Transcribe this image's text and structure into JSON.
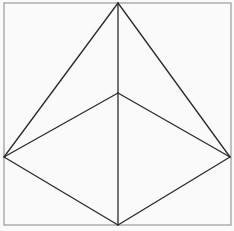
{
  "diagram": {
    "type": "geometric-figure",
    "colors": {
      "background": "#fafafa",
      "frame": "#9a9a9a",
      "lines": "#2a2a2a"
    },
    "frame": {
      "x": 4,
      "y": 3,
      "width": 227,
      "height": 222
    },
    "vertices": {
      "top": [
        118,
        3
      ],
      "middle": [
        118,
        93
      ],
      "left": [
        4,
        157
      ],
      "right": [
        230,
        157
      ],
      "bottom": [
        118,
        225
      ]
    },
    "edges": [
      [
        "top",
        "left"
      ],
      [
        "top",
        "right"
      ],
      [
        "top",
        "middle"
      ],
      [
        "middle",
        "left"
      ],
      [
        "middle",
        "right"
      ],
      [
        "middle",
        "bottom"
      ],
      [
        "left",
        "bottom"
      ],
      [
        "right",
        "bottom"
      ]
    ]
  }
}
